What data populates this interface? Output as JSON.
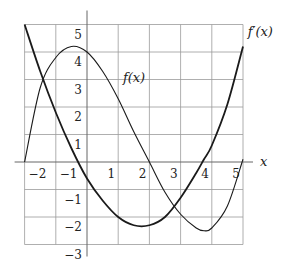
{
  "chart_data": {
    "type": "line",
    "title": "",
    "xlabel": "x",
    "ylabel": "",
    "xlim": [
      -2,
      5
    ],
    "ylim": [
      -3,
      5
    ],
    "grid": true,
    "legend": "inline labels",
    "x_ticks": [
      -2,
      -1,
      1,
      2,
      3,
      4,
      5
    ],
    "y_ticks": [
      5,
      4,
      3,
      2,
      1,
      -1,
      -2,
      -3
    ],
    "x": [
      -2,
      -1.5,
      -1,
      -0.5,
      0,
      0.5,
      1,
      1.5,
      2,
      2.5,
      3,
      3.5,
      3.75,
      4,
      4.5,
      5
    ],
    "series": [
      {
        "name": "f(x)",
        "style": "thin",
        "label_pos": [
          1.15,
          2.9
        ],
        "values": [
          0,
          2.7,
          3.8,
          4.2,
          4.0,
          3.3,
          2.3,
          1.1,
          0,
          -1.1,
          -1.9,
          -2.4,
          -2.5,
          -2.4,
          -1.6,
          0.1
        ]
      },
      {
        "name": "f'(x)",
        "style": "thick",
        "label_pos": [
          5.15,
          4.6
        ],
        "values": [
          5.0,
          3.3,
          1.8,
          0.5,
          -0.6,
          -1.4,
          -2.0,
          -2.3,
          -2.3,
          -2.0,
          -1.3,
          -0.4,
          0.1,
          0.6,
          2.1,
          4.2
        ]
      }
    ]
  },
  "labels": {
    "x_axis": "x",
    "f": "f(x)",
    "fprime": "f′(x)"
  },
  "colors": {
    "grid": "#9a9a9a",
    "axis": "#666666",
    "curve": "#1a1a1a"
  }
}
